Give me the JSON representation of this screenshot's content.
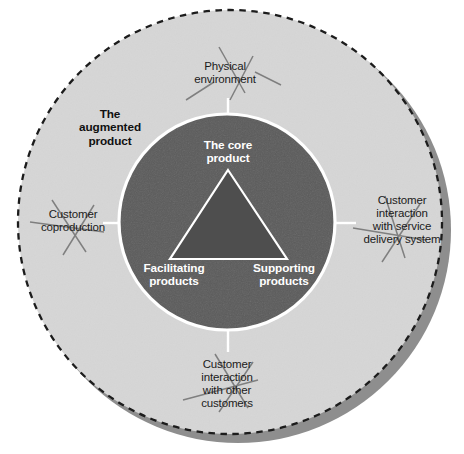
{
  "diagram": {
    "type": "concentric-circles",
    "colors": {
      "background": "#ffffff",
      "augmented_ring_fill": "#d6d6d6",
      "core_circle_fill": "#5b5b5b",
      "triangle_fill": "#4e4e4e",
      "triangle_stroke": "#ffffff",
      "core_circle_stroke": "#ffffff",
      "dashed_border": "#1c1c1c",
      "shadow_band": "#8e8e8e",
      "connector_line": "#ffffff",
      "outer_text": "#1b1b1b",
      "inner_text": "#ffffff"
    },
    "outer_labels": [
      {
        "key": "physical_environment",
        "text": "Physical\nenvironment",
        "position": "top"
      },
      {
        "key": "customer_coproduction",
        "text": "Customer\ncoproduction",
        "position": "left"
      },
      {
        "key": "customer_service_delivery",
        "text": "Customer\ninteraction\nwith service\ndelivery system",
        "position": "right"
      },
      {
        "key": "customer_other_customers",
        "text": "Customer\ninteraction\nwith other\ncustomers",
        "position": "bottom"
      }
    ],
    "ring_label": {
      "key": "augmented_product",
      "text": "The\naugmented\nproduct",
      "bold": true
    },
    "inner_labels": [
      {
        "key": "core_product",
        "text": "The core\nproduct",
        "position": "top-center"
      },
      {
        "key": "facilitating_products",
        "text": "Facilitating\nproducts",
        "position": "bottom-left"
      },
      {
        "key": "supporting_products",
        "text": "Supporting\nproducts",
        "position": "bottom-right"
      }
    ],
    "geometry": {
      "outer_circle_center_x": 230,
      "outer_circle_center_y": 222,
      "outer_circle_radius": 212,
      "inner_circle_center_x": 227,
      "inner_circle_center_y": 222,
      "inner_circle_radius": 108
    }
  }
}
